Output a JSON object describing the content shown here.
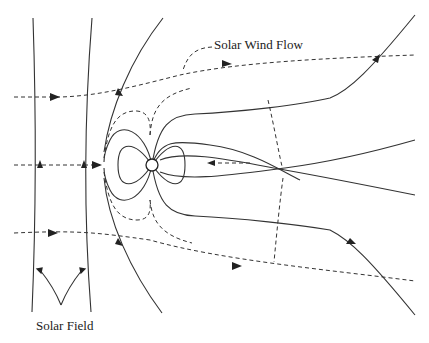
{
  "diagram": {
    "title": "",
    "labels": {
      "solar_wind": "Solar Wind Flow",
      "solar_field": "Solar Field"
    },
    "elements": {
      "planet": "planet-circle",
      "solar_field_lines": "vertical solid lines with downward arrows",
      "solar_wind_lines": "horizontal dashed lines with rightward arrows",
      "magnetosphere": "dipole field lines around planet with X-line reconnection tail"
    },
    "colors": {
      "line": "#333333",
      "background": "#ffffff"
    }
  }
}
